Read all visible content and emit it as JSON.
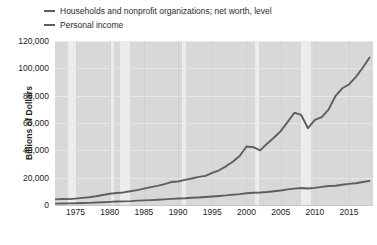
{
  "legend": {
    "position": "top-left",
    "items": [
      {
        "label": "Households and nonprofit organizations; net worth, level",
        "color": "#5e5e5e",
        "marker": "line-marker"
      },
      {
        "label": "Personal income",
        "color": "#5e5e5e",
        "marker": "line-marker"
      }
    ]
  },
  "axes": {
    "y_title": "Billions of Dollars",
    "y_ticks": [
      "0",
      "20,000",
      "40,000",
      "60,000",
      "80,000",
      "100,000",
      "120,000"
    ],
    "x_ticks": [
      "1975",
      "1980",
      "1985",
      "1990",
      "1995",
      "2000",
      "2005",
      "2010",
      "2015"
    ]
  },
  "colors": {
    "plot_background": "#d8d8d8",
    "recession_band": "#ececec",
    "gridline": "#eaeaea",
    "series": "#5e5e5e",
    "text": "#1c1c1c",
    "page_background": "#ffffff"
  },
  "chart_data": {
    "type": "line",
    "title": "",
    "subtitle": "",
    "xlabel": "",
    "ylabel": "Billions of Dollars",
    "xlim": [
      1972,
      2018.5
    ],
    "ylim": [
      0,
      120000
    ],
    "ytick_values": [
      0,
      20000,
      40000,
      60000,
      80000,
      100000,
      120000
    ],
    "xtick_values": [
      1975,
      1980,
      1985,
      1990,
      1995,
      2000,
      2005,
      2010,
      2015
    ],
    "grid": true,
    "legend_position": "top-left",
    "annotations": [
      {
        "kind": "recession-shading",
        "label": "1973-1975 recession",
        "x_start": 1973.9,
        "x_end": 1975.2
      },
      {
        "kind": "recession-shading",
        "label": "1980 recession",
        "x_start": 1980.0,
        "x_end": 1980.6
      },
      {
        "kind": "recession-shading",
        "label": "1981-1982 recession",
        "x_start": 1981.5,
        "x_end": 1982.9
      },
      {
        "kind": "recession-shading",
        "label": "1990-1991 recession",
        "x_start": 1990.6,
        "x_end": 1991.2
      },
      {
        "kind": "recession-shading",
        "label": "2001 recession",
        "x_start": 2001.2,
        "x_end": 2001.9
      },
      {
        "kind": "recession-shading",
        "label": "2007-2009 recession",
        "x_start": 2007.9,
        "x_end": 2009.5
      }
    ],
    "series": [
      {
        "name": "Households and nonprofit organizations; net worth, level",
        "color": "#5e5e5e",
        "x": [
          1972,
          1973,
          1974,
          1975,
          1976,
          1977,
          1978,
          1979,
          1980,
          1981,
          1982,
          1983,
          1984,
          1985,
          1986,
          1987,
          1988,
          1989,
          1990,
          1991,
          1992,
          1993,
          1994,
          1995,
          1996,
          1997,
          1998,
          1999,
          2000,
          2001,
          2002,
          2003,
          2004,
          2005,
          2006,
          2007,
          2008,
          2009,
          2010,
          2011,
          2012,
          2013,
          2014,
          2015,
          2016,
          2017,
          2018
        ],
        "values": [
          4100,
          4400,
          4300,
          4700,
          5200,
          5700,
          6400,
          7300,
          8200,
          8800,
          9200,
          10100,
          10900,
          12000,
          13100,
          14000,
          15300,
          16800,
          17200,
          18400,
          19400,
          20600,
          21300,
          23500,
          25400,
          28300,
          31600,
          35800,
          42800,
          42300,
          40000,
          44800,
          49200,
          54100,
          60600,
          67500,
          65900,
          56200,
          62300,
          64300,
          69800,
          79600,
          85400,
          88200,
          93700,
          100400,
          107900
        ]
      },
      {
        "name": "Personal income",
        "color": "#5e5e5e",
        "x": [
          1972,
          1973,
          1974,
          1975,
          1976,
          1977,
          1978,
          1979,
          1980,
          1981,
          1982,
          1983,
          1984,
          1985,
          1986,
          1987,
          1988,
          1989,
          1990,
          1991,
          1992,
          1993,
          1994,
          1995,
          1996,
          1997,
          1998,
          1999,
          2000,
          2001,
          2002,
          2003,
          2004,
          2005,
          2006,
          2007,
          2008,
          2009,
          2010,
          2011,
          2012,
          2013,
          2014,
          2015,
          2016,
          2017,
          2018
        ],
        "values": [
          970,
          1080,
          1180,
          1280,
          1420,
          1580,
          1790,
          2010,
          2260,
          2530,
          2680,
          2870,
          3180,
          3390,
          3590,
          3820,
          4150,
          4470,
          4760,
          4930,
          5260,
          5510,
          5820,
          6180,
          6590,
          7010,
          7550,
          7970,
          8630,
          8980,
          9150,
          9480,
          10060,
          10630,
          11390,
          12010,
          12460,
          12090,
          12550,
          13290,
          13900,
          14070,
          14810,
          15460,
          15930,
          16830,
          17620
        ]
      }
    ]
  }
}
